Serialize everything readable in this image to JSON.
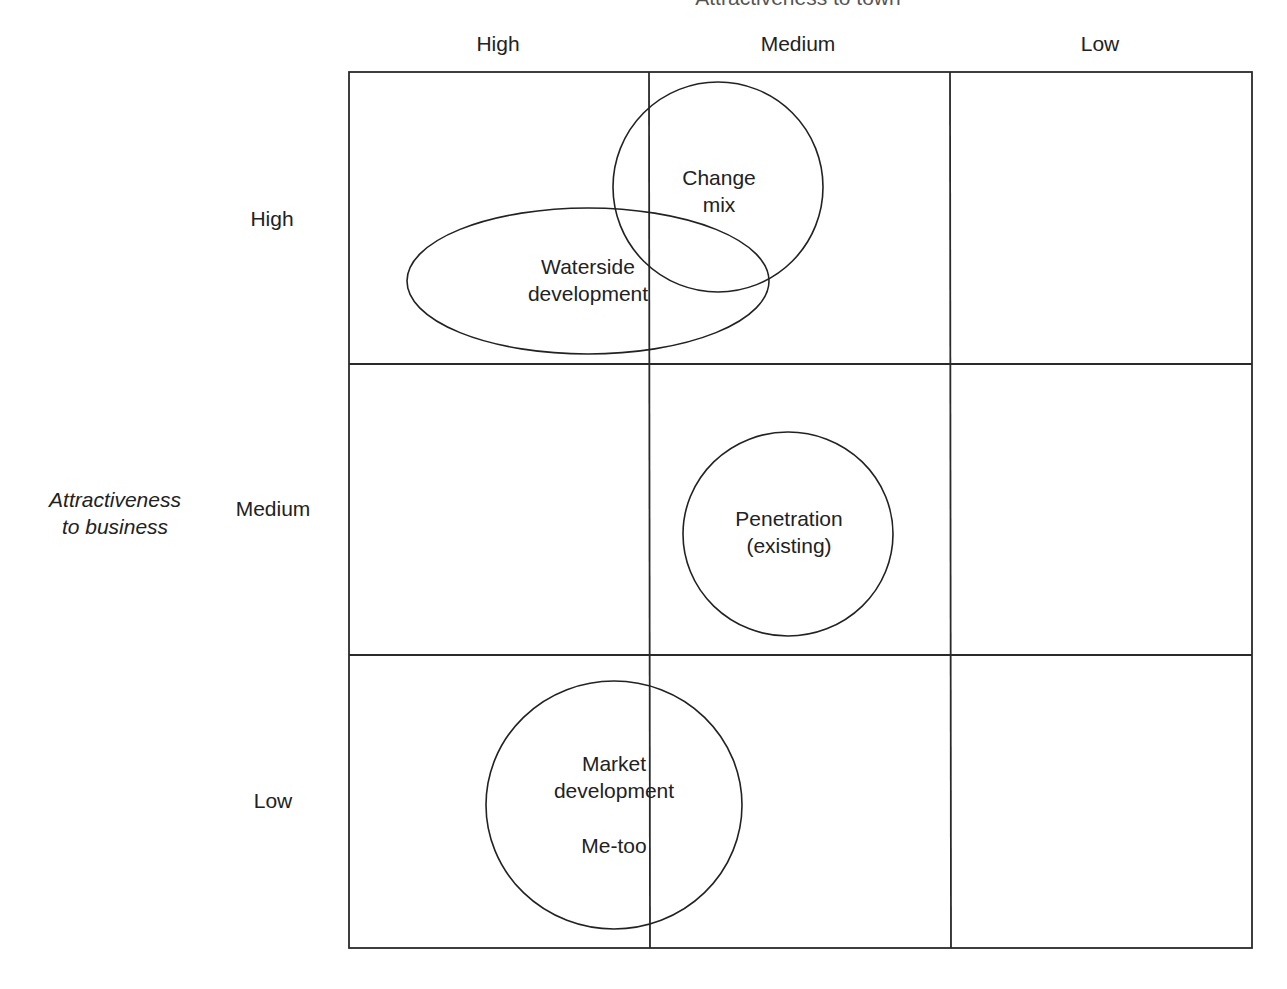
{
  "diagram": {
    "type": "matrix-with-ellipses",
    "x_axis": {
      "title": "Attractiveness to town",
      "columns": [
        "High",
        "Medium",
        "Low"
      ]
    },
    "y_axis": {
      "title_line1": "Attractiveness",
      "title_line2": "to business",
      "rows": [
        "High",
        "Medium",
        "Low"
      ]
    },
    "shapes": [
      {
        "id": "change-mix",
        "line1": "Change",
        "line2": "mix",
        "shape": "circle",
        "cx": 718,
        "cy": 187,
        "rx": 105,
        "ry": 105
      },
      {
        "id": "waterside-development",
        "line1": "Waterside",
        "line2": "development",
        "shape": "ellipse",
        "cx": 588,
        "cy": 281,
        "rx": 181,
        "ry": 73
      },
      {
        "id": "penetration-existing",
        "line1": "Penetration",
        "line2": "(existing)",
        "shape": "circle",
        "cx": 788,
        "cy": 534,
        "rx": 105,
        "ry": 102
      },
      {
        "id": "market-development",
        "line1": "Market",
        "line2": "development",
        "line3": "Me-too",
        "shape": "circle",
        "cx": 614,
        "cy": 805,
        "rx": 128,
        "ry": 124
      }
    ],
    "grid": {
      "left": 349,
      "top": 72,
      "right": 1252,
      "bottom": 948,
      "col_dividers": [
        649,
        950
      ],
      "row_dividers": [
        364,
        655
      ],
      "stroke": "#2a2a2a"
    }
  }
}
